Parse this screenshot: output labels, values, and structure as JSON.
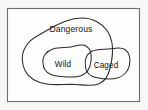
{
  "diagram": {
    "type": "euler-diagram",
    "title": "",
    "background_color": "#f7f7f5",
    "frame": {
      "name": "universe-rectangle",
      "fill": "#fdfdfc",
      "stroke": "#6e6e6e"
    },
    "stroke_color": "#2b2b2b",
    "text_color": "#141414",
    "sets": [
      {
        "id": "dangerous",
        "label": "Dangerous",
        "label_x": 71,
        "label_y": 30,
        "relation": "outermost region containing Wild and part of Caged"
      },
      {
        "id": "wild",
        "label": "Wild",
        "label_x": 63,
        "label_y": 65,
        "relation": "fully inside Dangerous; overlaps Caged"
      },
      {
        "id": "caged",
        "label": "Caged",
        "label_x": 104,
        "label_y": 66,
        "relation": "partly inside Dangerous; overlaps Wild"
      }
    ]
  }
}
